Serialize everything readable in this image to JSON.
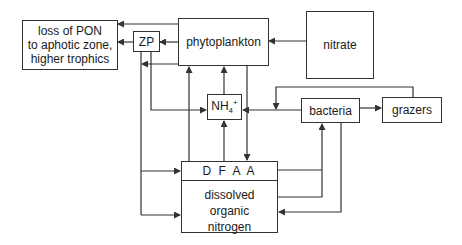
{
  "diagram": {
    "type": "flow",
    "colors": {
      "line": "#333333",
      "background": "#ffffff",
      "text": "#1a1a1a"
    },
    "nodes": {
      "loss": {
        "label": "loss of PON\nto aphotic zone,\nhigher trophics"
      },
      "zp": {
        "label": "ZP"
      },
      "phytoplankton": {
        "label": "phytoplankton"
      },
      "nitrate": {
        "label": "nitrate"
      },
      "nh4": {
        "label": "NH",
        "sub": "4",
        "sup": "+"
      },
      "bacteria": {
        "label": "bacteria"
      },
      "grazers": {
        "label": "grazers"
      },
      "dom": {
        "header": "D F A A",
        "label": "dissolved\norganic\nnitrogen"
      }
    },
    "edges": [
      {
        "from": "phytoplankton",
        "to": "loss"
      },
      {
        "from": "phytoplankton",
        "to": "zp"
      },
      {
        "from": "zp",
        "to": "loss"
      },
      {
        "from": "nitrate",
        "to": "phytoplankton"
      },
      {
        "from": "phytoplankton",
        "to": "zp-rail"
      },
      {
        "from": "zp",
        "to": "nh4"
      },
      {
        "from": "zp",
        "to": "dom"
      },
      {
        "from": "nh4",
        "to": "phytoplankton"
      },
      {
        "from": "dom",
        "to": "phytoplankton"
      },
      {
        "from": "dom",
        "to": "nh4"
      },
      {
        "from": "phytoplankton",
        "to": "dom"
      },
      {
        "from": "bacteria",
        "to": "nh4"
      },
      {
        "from": "bacteria",
        "to": "grazers"
      },
      {
        "from": "grazers",
        "to": "nh4"
      },
      {
        "from": "dom",
        "to": "bacteria"
      },
      {
        "from": "bacteria",
        "to": "dom"
      }
    ]
  }
}
